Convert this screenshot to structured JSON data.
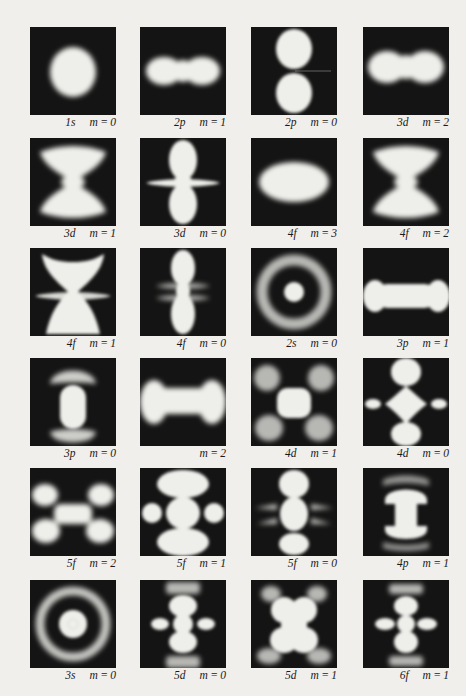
{
  "figure": {
    "panel_color": "#141414",
    "glow_color": "#eeeeea",
    "page_color": "#f1efec",
    "rows": [
      [
        {
          "orbital": "1s",
          "m": "m = 0",
          "shape": "sphere"
        },
        {
          "orbital": "2p",
          "m": "m = 1",
          "shape": "horizontal-dumbbell"
        },
        {
          "orbital": "2p",
          "m": "m = 0",
          "shape": "vertical-two-lobes"
        },
        {
          "orbital": "3d",
          "m": "m = 2",
          "shape": "wide-dumbbell"
        }
      ],
      [
        {
          "orbital": "3d",
          "m": "m = 1",
          "shape": "butterfly"
        },
        {
          "orbital": "3d",
          "m": "m = 0",
          "shape": "vertical-lobes-with-ring"
        },
        {
          "orbital": "4f",
          "m": "m = 3",
          "shape": "ellipse"
        },
        {
          "orbital": "4f",
          "m": "m = 2",
          "shape": "butterfly"
        }
      ],
      [
        {
          "orbital": "4f",
          "m": "m = 1",
          "shape": "cup-hourglass"
        },
        {
          "orbital": "4f",
          "m": "m = 0",
          "shape": "vertical-lobes-double-ring"
        },
        {
          "orbital": "2s",
          "m": "m = 0",
          "shape": "ring-with-core"
        },
        {
          "orbital": "3p",
          "m": "m = 1",
          "shape": "bone"
        }
      ],
      [
        {
          "orbital": "3p",
          "m": "m = 0",
          "shape": "vertical-capsule-with-caps"
        },
        {
          "orbital": "",
          "m": "m = 2",
          "shape": "bone-wide"
        },
        {
          "orbital": "4d",
          "m": "m = 1",
          "shape": "center-with-four-lobes"
        },
        {
          "orbital": "4d",
          "m": "m = 0",
          "shape": "diamond-with-lobes"
        }
      ],
      [
        {
          "orbital": "5f",
          "m": "m = 2",
          "shape": "x-four-lobes"
        },
        {
          "orbital": "5f",
          "m": "m = 1",
          "shape": "cross-stack"
        },
        {
          "orbital": "5f",
          "m": "m = 0",
          "shape": "vertical-with-side-spikes"
        },
        {
          "orbital": "4p",
          "m": "m = 1",
          "shape": "mushroom-stack"
        }
      ],
      [
        {
          "orbital": "3s",
          "m": "m = 0",
          "shape": "double-ring"
        },
        {
          "orbital": "5d",
          "m": "m = 0",
          "shape": "totem"
        },
        {
          "orbital": "5d",
          "m": "m = 1",
          "shape": "clover-stack"
        },
        {
          "orbital": "6f",
          "m": "m = 1",
          "shape": "totem-narrow"
        }
      ]
    ]
  }
}
